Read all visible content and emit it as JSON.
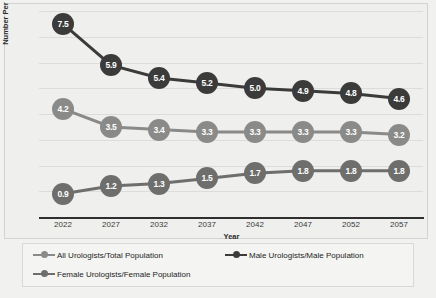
{
  "chart_data": {
    "type": "line",
    "title": "",
    "xlabel": "Year",
    "ylabel": "Number Per 100,000",
    "categories": [
      "2022",
      "2027",
      "2032",
      "2037",
      "2042",
      "2047",
      "2052",
      "2057"
    ],
    "ylim": [
      0,
      8
    ],
    "ytick_labels_visible": false,
    "grid": "horizontal",
    "legend_position": "bottom",
    "series": [
      {
        "name": "All Urologists/Total Population",
        "color": "#8a8a88",
        "values": [
          4.2,
          3.5,
          3.4,
          3.3,
          3.3,
          3.3,
          3.3,
          3.2
        ],
        "labels": [
          "4.2",
          "3.5",
          "3.4",
          "3.3",
          "3.3",
          "3.3",
          "3.3",
          "3.2"
        ]
      },
      {
        "name": "Male Urologists/Male Population",
        "color": "#3b3b3b",
        "values": [
          7.5,
          5.9,
          5.4,
          5.2,
          5.0,
          4.9,
          4.8,
          4.6
        ],
        "labels": [
          "7.5",
          "5.9",
          "5.4",
          "5.2",
          "5.0",
          "4.9",
          "4.8",
          "4.6"
        ]
      },
      {
        "name": "Female Urologists/Female Population",
        "color": "#6e6e6c",
        "values": [
          0.9,
          1.2,
          1.3,
          1.5,
          1.7,
          1.8,
          1.8,
          1.8
        ],
        "labels": [
          "0.9",
          "1.2",
          "1.3",
          "1.5",
          "1.7",
          "1.8",
          "1.8",
          "1.8"
        ]
      }
    ]
  },
  "axis": {
    "ylabel": "Number Per 100,000",
    "xlabel": "Year"
  },
  "legend": {
    "all": "All Urologists/Total Population",
    "male": "Male Urologists/Male Population",
    "female": "Female Urologists/Female Population"
  }
}
